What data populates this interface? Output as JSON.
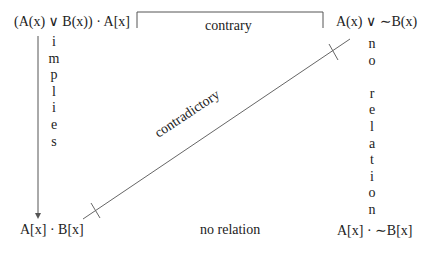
{
  "corners": {
    "top_left": "(A(x) ∨ B(x)) · A[x]",
    "top_right": "A(x) ∨ ∼B(x)",
    "bottom_left": "A[x] · B[x]",
    "bottom_right": "A[x] · ∼B[x]"
  },
  "relations": {
    "top": "contrary",
    "diagonal": "contradictory",
    "left_vertical": "implies",
    "right_vertical": "no relation",
    "bottom": "no relation"
  },
  "left_letters": [
    "i",
    "m",
    "p",
    "l",
    "i",
    "e",
    "s"
  ],
  "right_letters": [
    "n",
    "o",
    "",
    "r",
    "e",
    "l",
    "a",
    "t",
    "i",
    "o",
    "n"
  ],
  "colors": {
    "line": "#555555",
    "text": "#222222"
  }
}
